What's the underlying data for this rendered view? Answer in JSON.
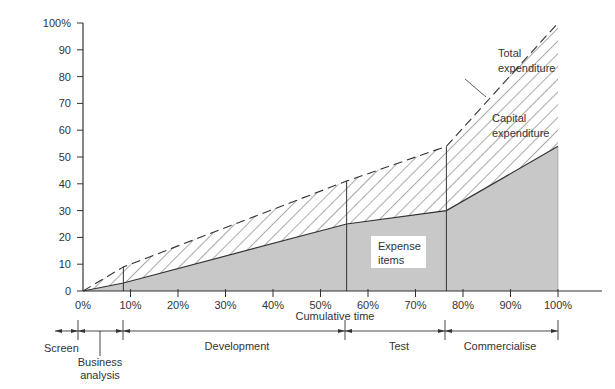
{
  "chart_data": {
    "type": "area",
    "title": "",
    "xlabel": "Cumulative time",
    "ylabel": "",
    "xlim": [
      0,
      100
    ],
    "ylim": [
      0,
      100
    ],
    "grid": false,
    "x_ticks": [
      "0%",
      "10%",
      "20%",
      "30%",
      "40%",
      "50%",
      "60%",
      "70%",
      "80%",
      "90%",
      "100%"
    ],
    "y_ticks": [
      "0",
      "10",
      "20",
      "30",
      "40",
      "50",
      "60",
      "70",
      "80",
      "90",
      "100%"
    ],
    "x": [
      0,
      8.5,
      55.5,
      76.5,
      100
    ],
    "series": [
      {
        "name": "Total expenditure",
        "style": "dashed line",
        "values": [
          0,
          9,
          41,
          54,
          100
        ]
      },
      {
        "name": "Expense items",
        "style": "grey filled area",
        "values": [
          0,
          3,
          25,
          30,
          54
        ]
      },
      {
        "name": "Capital expenditure",
        "style": "hatched area between expense items and total expenditure"
      }
    ],
    "stage_boundaries_pct": [
      8.5,
      55.5,
      76.5
    ],
    "annotations": [
      {
        "text": "Total expenditure",
        "position": "upper right, pointer to dashed line"
      },
      {
        "text": "Capital expenditure",
        "position": "inside hatched region, right side"
      },
      {
        "text": "Expense items",
        "position": "inside grey region, boxed label"
      }
    ],
    "stages": [
      {
        "label": "Screen",
        "start": 0,
        "end": 3
      },
      {
        "label": "Business analysis",
        "start": 3,
        "end": 8.5
      },
      {
        "label": "Development",
        "start": 8.5,
        "end": 55.5
      },
      {
        "label": "Test",
        "start": 55.5,
        "end": 76.5
      },
      {
        "label": "Commercialise",
        "start": 76.5,
        "end": 100
      }
    ]
  },
  "labels": {
    "total_expenditure_line1": "Total",
    "total_expenditure_line2": "expenditure",
    "capital_expenditure_line1": "Capital",
    "capital_expenditure_line2": "expenditure",
    "expense_items_line1": "Expense",
    "expense_items_line2": "items",
    "x_axis_title": "Cumulative time",
    "stage_screen": "Screen",
    "stage_business_line1": "Business",
    "stage_business_line2": "analysis",
    "stage_development": "Development",
    "stage_test": "Test",
    "stage_commercialise": "Commercialise"
  },
  "colors": {
    "expense_fill": "#c8c8c8",
    "line": "#333333",
    "hatch": "#555555"
  }
}
